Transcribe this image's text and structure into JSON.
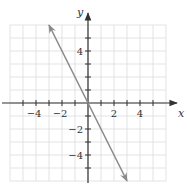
{
  "chart_data": {
    "type": "line",
    "title": "",
    "xlabel": "x",
    "ylabel": "y",
    "xlim": [
      -6,
      6
    ],
    "ylim": [
      -6,
      6
    ],
    "grid": true,
    "x_ticks": [
      -5,
      -4,
      -3,
      -2,
      -1,
      1,
      2,
      3,
      4,
      5
    ],
    "y_ticks": [
      -5,
      -4,
      -3,
      -2,
      -1,
      1,
      2,
      3,
      4,
      5
    ],
    "x_tick_labels": [
      {
        "value": -4,
        "label": "−4"
      },
      {
        "value": -2,
        "label": "−2"
      },
      {
        "value": 2,
        "label": "2"
      },
      {
        "value": 4,
        "label": "4"
      }
    ],
    "y_tick_labels": [
      {
        "value": 4,
        "label": "4"
      },
      {
        "value": -2,
        "label": "−2"
      },
      {
        "value": -4,
        "label": "−4"
      }
    ],
    "series": [
      {
        "name": "y = -2x",
        "points": [
          [
            -3,
            6
          ],
          [
            3,
            -6
          ]
        ],
        "arrows": "both"
      }
    ],
    "colors": {
      "line": "#8a8a8a",
      "axis": "#333333",
      "grid": "#dcdcdc"
    }
  },
  "layout": {
    "origin_px": [
      88,
      103
    ],
    "unit_px": 13
  }
}
